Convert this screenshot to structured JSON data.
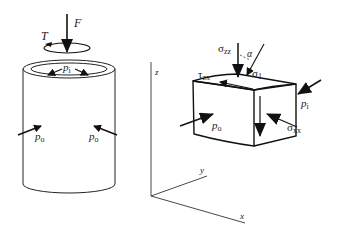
{
  "figure": {
    "left_panel": {
      "description": "Hollow cylinder under axial force, torque, internal and external pressure",
      "labels": {
        "force": "F",
        "torque": "T",
        "internal_pressure": "p",
        "internal_pressure_sub": "i",
        "external_pressure_left": "p",
        "external_pressure_left_sub": "o",
        "external_pressure_right": "p",
        "external_pressure_right_sub": "o"
      }
    },
    "right_panel": {
      "description": "Stress element with coordinate axes",
      "labels": {
        "sigma_zz": "σ",
        "sigma_zz_sub": "zz",
        "alpha": "α",
        "sigma_1": "σ",
        "sigma_1_sub": "1",
        "tau_zx": "τ",
        "tau_zx_sub": "zx",
        "p_i": "p",
        "p_i_sub": "i",
        "p_o": "p",
        "p_o_sub": "o",
        "sigma_xx": "σ",
        "sigma_xx_sub": "xx"
      },
      "axes": {
        "z": "z",
        "y": "y",
        "x": "x"
      }
    }
  }
}
